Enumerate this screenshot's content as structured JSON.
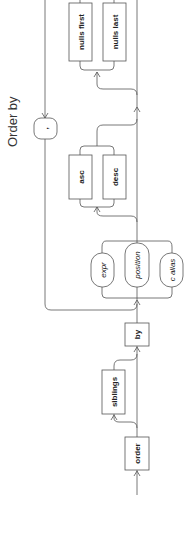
{
  "title": "Order by",
  "terminals": {
    "order": "order",
    "siblings": "siblings",
    "by": "by",
    "asc": "asc",
    "desc": "desc",
    "nulls_first": "nulls first",
    "nulls_last": "nulls last",
    "separator": ","
  },
  "nonterminals": {
    "expr": "expr",
    "position": "position",
    "c_alias": "c alias"
  },
  "colors": {
    "line": "#555555",
    "text": "#222222",
    "background": "#ffffff"
  }
}
